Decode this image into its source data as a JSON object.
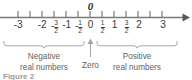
{
  "figure": {
    "caption": "Figure 2",
    "zero_marker_label": "0",
    "axis": {
      "min": -3.25,
      "max": 3.18,
      "arrow_direction": "right",
      "line_color": "#7a7a7a",
      "label_color": "#3a3a3a"
    },
    "ticks": [
      {
        "value": -3,
        "label": "-3",
        "type": "integer"
      },
      {
        "value": -2.5,
        "label": "",
        "type": "unlabeled"
      },
      {
        "value": -2,
        "label": "-2",
        "type": "integer"
      },
      {
        "value": -1.5,
        "label": "-3/2",
        "type": "fraction",
        "sign": "-",
        "num": "3",
        "den": "2"
      },
      {
        "value": -1,
        "label": "-1",
        "type": "integer"
      },
      {
        "value": -0.5,
        "label": "-1/2",
        "type": "fraction",
        "sign": "-",
        "num": "1",
        "den": "2"
      },
      {
        "value": 0,
        "label": "0",
        "type": "integer"
      },
      {
        "value": 0.5,
        "label": "1/2",
        "type": "fraction",
        "sign": "",
        "num": "1",
        "den": "2"
      },
      {
        "value": 1,
        "label": "1",
        "type": "integer"
      },
      {
        "value": 1.5,
        "label": "3/2",
        "type": "fraction",
        "sign": "",
        "num": "3",
        "den": "2"
      },
      {
        "value": 2,
        "label": "2",
        "type": "integer"
      },
      {
        "value": 2.5,
        "label": "",
        "type": "unlabeled"
      },
      {
        "value": 3,
        "label": "3",
        "type": "integer"
      }
    ],
    "annotations": {
      "negative": {
        "line1": "Negative",
        "line2": "real numbers",
        "range": [
          -3.25,
          -0.12
        ],
        "brace": "under-brace"
      },
      "zero": {
        "line1": "Zero",
        "line2": "",
        "value": 0,
        "pointer": "up-arrow"
      },
      "positive": {
        "line1": "Positive",
        "line2": "real numbers",
        "range": [
          0.12,
          3.18
        ],
        "brace": "under-brace"
      }
    }
  }
}
